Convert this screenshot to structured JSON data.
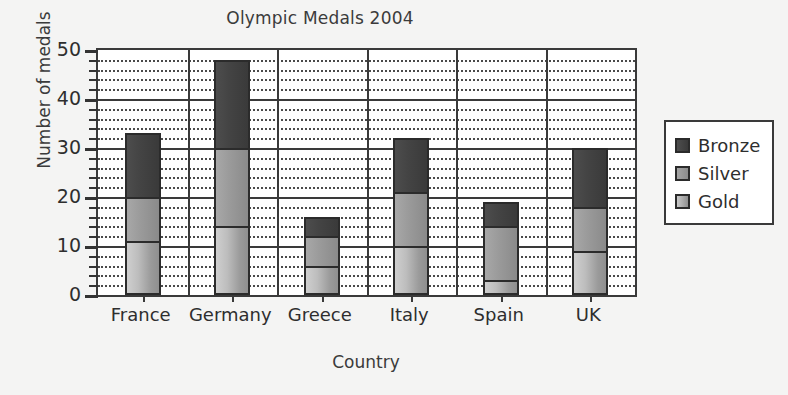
{
  "chart_data": {
    "type": "bar",
    "subtype": "stacked-bar",
    "title": "Olympic Medals 2004",
    "xlabel": "Country",
    "ylabel": "Number of medals",
    "categories": [
      "France",
      "Germany",
      "Greece",
      "Italy",
      "Spain",
      "UK"
    ],
    "series": [
      {
        "name": "Gold",
        "color": "#b4b4b4",
        "values": [
          11,
          14,
          6,
          10,
          3,
          9
        ]
      },
      {
        "name": "Silver",
        "color": "#949494",
        "values": [
          9,
          16,
          6,
          11,
          11,
          9
        ]
      },
      {
        "name": "Bronze",
        "color": "#444444",
        "values": [
          13,
          18,
          4,
          11,
          5,
          12
        ]
      }
    ],
    "cumulative_tops": {
      "France": {
        "gold": 11,
        "silver": 20,
        "total": 33
      },
      "Germany": {
        "gold": 14,
        "silver": 30,
        "total": 48
      },
      "Greece": {
        "gold": 6,
        "silver": 12,
        "total": 16
      },
      "Italy": {
        "gold": 10,
        "silver": 21,
        "total": 32
      },
      "Spain": {
        "gold": 3,
        "silver": 14,
        "total": 19
      },
      "UK": {
        "gold": 9,
        "silver": 18,
        "total": 30
      }
    },
    "totals": [
      33,
      48,
      16,
      32,
      19,
      30
    ],
    "ylim": [
      0,
      50
    ],
    "ytick_labels": [
      "0",
      "10",
      "20",
      "30",
      "40",
      "50"
    ],
    "ytick_values": [
      0,
      10,
      20,
      30,
      40,
      50
    ],
    "yminor_step": 2,
    "grid": "horizontal-dotted-minor-solid-major",
    "legend_position": "right-outside",
    "legend_entries": [
      "Bronze",
      "Silver",
      "Gold"
    ],
    "stack_order_bottom_to_top": [
      "Gold",
      "Silver",
      "Bronze"
    ]
  },
  "legend": {
    "items": [
      {
        "label": "Bronze",
        "swatch": "bronze"
      },
      {
        "label": "Silver",
        "swatch": "silver"
      },
      {
        "label": "Gold",
        "swatch": "gold"
      }
    ]
  },
  "colors": {
    "background": "#f4f4f3",
    "plot_background": "#ffffff",
    "axis": "#3a3a3a",
    "text": "#2e2e2e",
    "gold": "#b4b4b4",
    "silver": "#949494",
    "bronze": "#444444"
  }
}
